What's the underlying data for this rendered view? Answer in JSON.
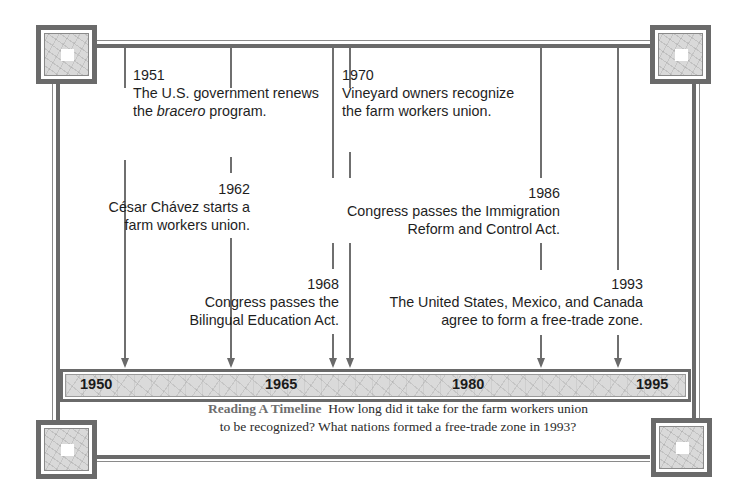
{
  "timeline": {
    "scale_labels": [
      {
        "year": "1950",
        "x": 80
      },
      {
        "year": "1965",
        "x": 265
      },
      {
        "year": "1980",
        "x": 452
      },
      {
        "year": "1995",
        "x": 636
      }
    ],
    "events": [
      {
        "year": "1951",
        "lines": [
          "The U.S. government renews",
          "the bracero program."
        ],
        "italic_word": "bracero"
      },
      {
        "year": "1962",
        "lines": [
          "César Chávez starts a",
          "farm workers union."
        ]
      },
      {
        "year": "1968",
        "lines": [
          "Congress passes the",
          "Bilingual Education Act."
        ]
      },
      {
        "year": "1970",
        "lines": [
          "Vineyard owners recognize",
          "the farm workers union."
        ]
      },
      {
        "year": "1986",
        "lines": [
          "Congress passes the Immigration",
          "Reform and Control Act."
        ]
      },
      {
        "year": "1993",
        "lines": [
          "The United States, Mexico, and Canada",
          "agree to form a free-trade zone."
        ]
      }
    ]
  },
  "caption": {
    "heading": "Reading A Timeline",
    "line1_rest": "How long did it take for the farm workers union",
    "line2": "to be recognized? What nations formed a free-trade zone in 1993?"
  },
  "colors": {
    "frame": "#6a6a6a",
    "bar_fill": "#dadada",
    "text": "#1e1e1e",
    "caption_heading": "#6e6e6e"
  }
}
